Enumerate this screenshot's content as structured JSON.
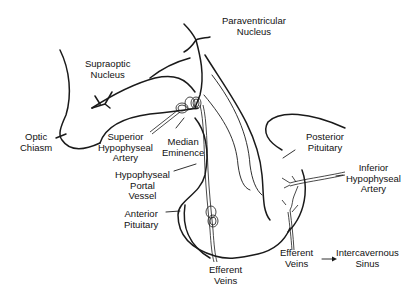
{
  "diagram": {
    "background_color": "#ffffff",
    "line_color": "#1a1a1a",
    "labels": {
      "paraventricular_nucleus": [
        "Paraventricular",
        "Nucleus"
      ],
      "supraoptic_nucleus": [
        "Supraoptic",
        "Nucleus"
      ],
      "optic_chiasm": [
        "Optic",
        "Chiasm"
      ],
      "superior_hypophyseal_artery": [
        "Superior",
        "Hypophyseal",
        "Artery"
      ],
      "median_eminence": [
        "Median",
        "Eminence"
      ],
      "hypophyseal_portal_vessel": [
        "Hypophyseal",
        "Portal",
        "Vessel"
      ],
      "anterior_pituitary": [
        "Anterior",
        "Pituitary"
      ],
      "efferent_veins_anterior": [
        "Efferent",
        "Veins"
      ],
      "posterior_pituitary": [
        "Posterior",
        "Pituitary"
      ],
      "inferior_hypophyseal_artery": [
        "Inferior",
        "Hypophyseal",
        "Artery"
      ],
      "efferent_veins_posterior": [
        "Efferent",
        "Veins"
      ],
      "intercavernous_sinus": [
        "Intercavernous",
        "Sinus"
      ]
    },
    "flow_arrow": {
      "from": "Efferent Veins",
      "to": "Intercavernous Sinus",
      "glyph": "→"
    }
  }
}
